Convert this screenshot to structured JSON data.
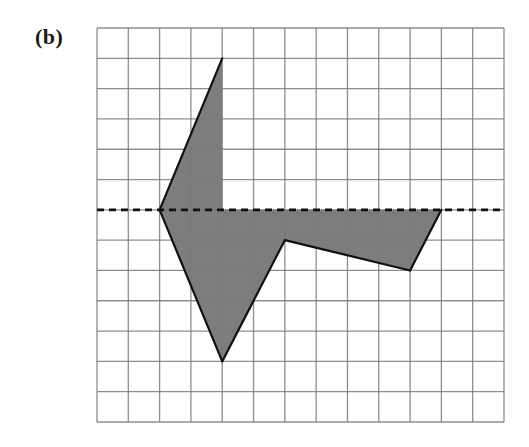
{
  "figure": {
    "label": "(b)"
  },
  "grid": {
    "columns": 13,
    "rows": 13,
    "left_px": 97,
    "top_px": 28,
    "right_px": 504,
    "bottom_px": 422,
    "line_color": "#7a7a7a"
  },
  "mirror_line": {
    "orientation": "horizontal",
    "grid_y": 6,
    "style": "dashed",
    "color": "#111111"
  },
  "shape": {
    "fill_color": "#7d7d7d",
    "stroke_color": "#111111",
    "vertices_grid": [
      [
        4,
        1
      ],
      [
        4,
        6
      ],
      [
        11,
        6
      ],
      [
        10,
        8
      ],
      [
        6,
        7
      ],
      [
        4,
        11
      ],
      [
        2,
        6
      ]
    ],
    "outlined_edges": [
      [
        [
          4,
          1
        ],
        [
          2,
          6
        ]
      ],
      [
        [
          2,
          6
        ],
        [
          4,
          11
        ]
      ],
      [
        [
          4,
          11
        ],
        [
          6,
          7
        ]
      ],
      [
        [
          6,
          7
        ],
        [
          10,
          8
        ]
      ],
      [
        [
          10,
          8
        ],
        [
          11,
          6
        ]
      ]
    ]
  }
}
